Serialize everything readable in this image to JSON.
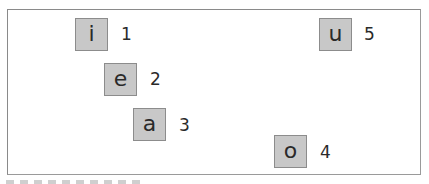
{
  "diagram": {
    "items": [
      {
        "letter": "i",
        "number": "1",
        "box": {
          "x": 75,
          "y": 18
        },
        "num_pos": {
          "x": 121,
          "y": 26
        }
      },
      {
        "letter": "e",
        "number": "2",
        "box": {
          "x": 104,
          "y": 63
        },
        "num_pos": {
          "x": 150,
          "y": 71
        }
      },
      {
        "letter": "a",
        "number": "3",
        "box": {
          "x": 133,
          "y": 108
        },
        "num_pos": {
          "x": 179,
          "y": 117
        }
      },
      {
        "letter": "o",
        "number": "4",
        "box": {
          "x": 274,
          "y": 135
        },
        "num_pos": {
          "x": 320,
          "y": 144
        }
      },
      {
        "letter": "u",
        "number": "5",
        "box": {
          "x": 319,
          "y": 18
        },
        "num_pos": {
          "x": 364,
          "y": 26
        }
      }
    ],
    "colors": {
      "tile_fill": "#c8c8c8",
      "tile_border": "#8c8c8c",
      "frame_border": "#8a8a8a",
      "text": "#2a2a2a"
    }
  }
}
